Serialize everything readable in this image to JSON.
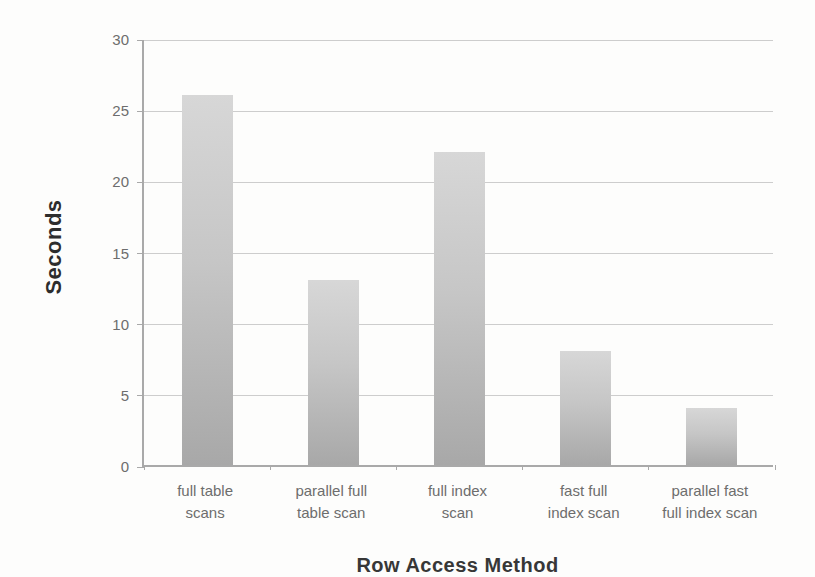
{
  "chart_data": {
    "type": "bar",
    "title": "",
    "xlabel": "Row Access Method",
    "ylabel": "Seconds",
    "ylim": [
      0,
      30
    ],
    "ytick_step": 5,
    "yticks": [
      0,
      5,
      10,
      15,
      20,
      25,
      30
    ],
    "grid": true,
    "legend": "none",
    "categories": [
      "full table scans",
      "parallel full table scan",
      "full index scan",
      "fast full index scan",
      "parallel fast full index scan"
    ],
    "category_lines": [
      [
        "full table",
        "scans"
      ],
      [
        "parallel full",
        "table scan"
      ],
      [
        "full index",
        "scan"
      ],
      [
        "fast full",
        "index scan"
      ],
      [
        "parallel fast",
        "full index scan"
      ]
    ],
    "values": [
      26,
      13,
      22,
      8,
      4
    ]
  },
  "style": {
    "bar_color_top": "#d7d7d7",
    "bar_color_mid": "#c6c6c6",
    "bar_color_bottom": "#a8a8a8",
    "gridline_color": "#cdcdcd",
    "axis_color": "#a9a9a9",
    "tick_label_color": "#6d6d6d",
    "axis_title_color": "#2d2d2d",
    "background_color": "#fdfdfc"
  }
}
